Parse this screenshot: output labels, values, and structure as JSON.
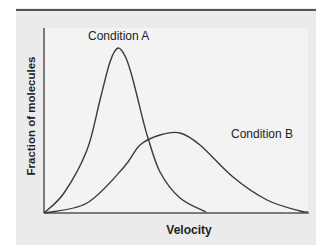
{
  "chart_data": {
    "type": "line",
    "title": "",
    "xlabel": "Velocity",
    "ylabel": "Fraction of molecules",
    "grid": false,
    "legend": "none (direct annotations)",
    "x_ticks": [],
    "y_ticks": [],
    "annotations": [
      "Condition A",
      "Condition B"
    ],
    "series": [
      {
        "name": "Condition A",
        "description": "narrow, tall peak at low velocity",
        "points_px": [
          [
            44,
            213
          ],
          [
            64,
            193
          ],
          [
            87,
            150
          ],
          [
            100,
            100
          ],
          [
            110,
            62
          ],
          [
            118,
            48
          ],
          [
            126,
            58
          ],
          [
            133,
            80
          ],
          [
            143,
            120
          ],
          [
            148,
            138
          ],
          [
            160,
            172
          ],
          [
            180,
            198
          ],
          [
            206,
            212
          ]
        ]
      },
      {
        "name": "Condition B",
        "description": "broad, lower peak at higher velocity",
        "points_px": [
          [
            44,
            213
          ],
          [
            87,
            203
          ],
          [
            124,
            167
          ],
          [
            140,
            145
          ],
          [
            160,
            135
          ],
          [
            180,
            133
          ],
          [
            200,
            145
          ],
          [
            233,
            177
          ],
          [
            267,
            200
          ],
          [
            300,
            211
          ],
          [
            308,
            212
          ]
        ]
      }
    ],
    "relative_peaks": {
      "Condition A": {
        "x_rel": 0.28,
        "y_rel": 0.89
      },
      "Condition B": {
        "x_rel": 0.52,
        "y_rel": 0.43
      }
    }
  },
  "labels": {
    "xlabel": "Velocity",
    "ylabel": "Fraction of molecules",
    "condition_a": "Condition A",
    "condition_b": "Condition B"
  },
  "colors": {
    "panel": "#ebebeb",
    "plot_area": "#f3f3f3",
    "top_rule": "#555555",
    "curves": "#3a3a3a",
    "axes": "#555555"
  }
}
